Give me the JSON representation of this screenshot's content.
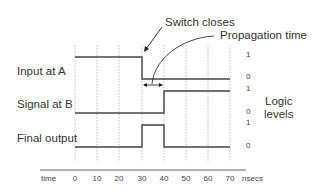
{
  "diagram": {
    "annotations": {
      "switch_closes": "Switch closes",
      "propagation_time": "Propagation time"
    },
    "signals": [
      {
        "label": "Input at A",
        "transitions": [
          {
            "t": 0,
            "level": 1
          },
          {
            "t": 30,
            "level": 0
          }
        ]
      },
      {
        "label": "Signal at B",
        "transitions": [
          {
            "t": 0,
            "level": 0
          },
          {
            "t": 40,
            "level": 1
          }
        ]
      },
      {
        "label": "Final output",
        "transitions": [
          {
            "t": 0,
            "level": 0
          },
          {
            "t": 30,
            "level": 1
          },
          {
            "t": 40,
            "level": 0
          }
        ]
      }
    ],
    "logic_levels_label": "Logic\nlevels",
    "logic_levels_line1": "Logic",
    "logic_levels_line2": "levels",
    "level_ticks": [
      "1",
      "0",
      "1",
      "0",
      "1",
      "0"
    ],
    "time_axis": {
      "label": "time",
      "ticks": [
        "0",
        "10",
        "20",
        "30",
        "40",
        "50",
        "60",
        "70"
      ],
      "unit": "nsecs"
    }
  }
}
